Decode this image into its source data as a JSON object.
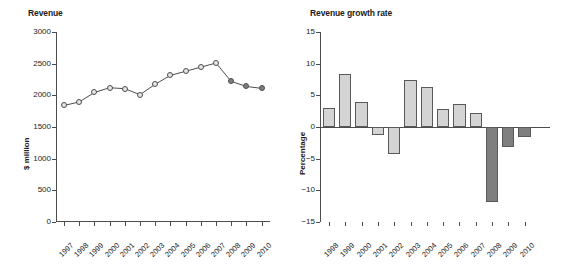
{
  "figure": {
    "background": "#ffffff",
    "panels": [
      "revenue",
      "growth"
    ]
  },
  "panels": {
    "revenue": {
      "title": "Revenue",
      "ylabel": "$ million",
      "yticks": [
        "0",
        "500",
        "1000",
        "1500",
        "2000",
        "2500",
        "3000"
      ],
      "xticks": [
        "1997",
        "1998",
        "1999",
        "2000",
        "2001",
        "2002",
        "2003",
        "2004",
        "2005",
        "2006",
        "2007",
        "2008",
        "2009",
        "2010"
      ]
    },
    "growth": {
      "title": "Revenue growth rate",
      "ylabel": "Percentage",
      "yticks": [
        "-15",
        "-10",
        "-5",
        "0",
        "5",
        "10",
        "15"
      ],
      "xticks": [
        "1998",
        "1999",
        "2000",
        "2001",
        "2002",
        "2003",
        "2004",
        "2005",
        "2006",
        "2007",
        "2008",
        "2009",
        "2010"
      ]
    }
  },
  "colors": {
    "light_fill": "#d4d4d4",
    "dark_fill": "#7f7f7f",
    "outline": "#4d4d4d",
    "text": "#1a1a1a"
  },
  "chart_data": [
    {
      "type": "line",
      "title": "Revenue",
      "xlabel": "",
      "ylabel": "$ million",
      "ylim": [
        0,
        3000
      ],
      "ytick_values": [
        0,
        500,
        1000,
        1500,
        2000,
        2500,
        3000
      ],
      "grid": false,
      "legend": "none",
      "categories": [
        "1997",
        "1998",
        "1999",
        "2000",
        "2001",
        "2002",
        "2003",
        "2004",
        "2005",
        "2006",
        "2007",
        "2008",
        "2009",
        "2010"
      ],
      "values": [
        1840,
        1895,
        2045,
        2120,
        2105,
        2010,
        2175,
        2315,
        2380,
        2445,
        2510,
        2220,
        2140,
        2110
      ],
      "point_styles": [
        "light",
        "light",
        "light",
        "light",
        "light",
        "light",
        "light",
        "light",
        "light",
        "light",
        "light",
        "dark",
        "dark",
        "dark"
      ]
    },
    {
      "type": "bar",
      "title": "Revenue growth rate",
      "xlabel": "",
      "ylabel": "Percentage",
      "ylim": [
        -15,
        15
      ],
      "ytick_values": [
        -15,
        -10,
        -5,
        0,
        5,
        10,
        15
      ],
      "grid": false,
      "legend": "none",
      "categories": [
        "1998",
        "1999",
        "2000",
        "2001",
        "2002",
        "2003",
        "2004",
        "2005",
        "2006",
        "2007",
        "2008",
        "2009",
        "2010"
      ],
      "values": [
        3.0,
        8.3,
        4.0,
        -1.2,
        -4.3,
        7.5,
        6.3,
        2.8,
        3.7,
        2.2,
        -11.9,
        -3.2,
        -1.6
      ],
      "bar_styles": [
        "light",
        "light",
        "light",
        "light",
        "light",
        "light",
        "light",
        "light",
        "light",
        "light",
        "dark",
        "dark",
        "dark"
      ]
    }
  ]
}
